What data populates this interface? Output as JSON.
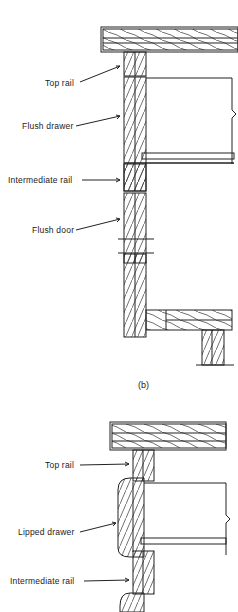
{
  "figure_b": {
    "labels": {
      "top_rail": "Top rail",
      "flush_drawer": "Flush drawer",
      "intermediate_rail": "Intermediate rail",
      "flush_door": "Flush door"
    },
    "caption": "(b)"
  },
  "figure_c": {
    "labels": {
      "top_rail": "Top rail",
      "lipped_drawer": "Lipped drawer",
      "intermediate_rail": "Intermediate rail"
    }
  },
  "colors": {
    "line": "#222222",
    "background": "#ffffff"
  }
}
